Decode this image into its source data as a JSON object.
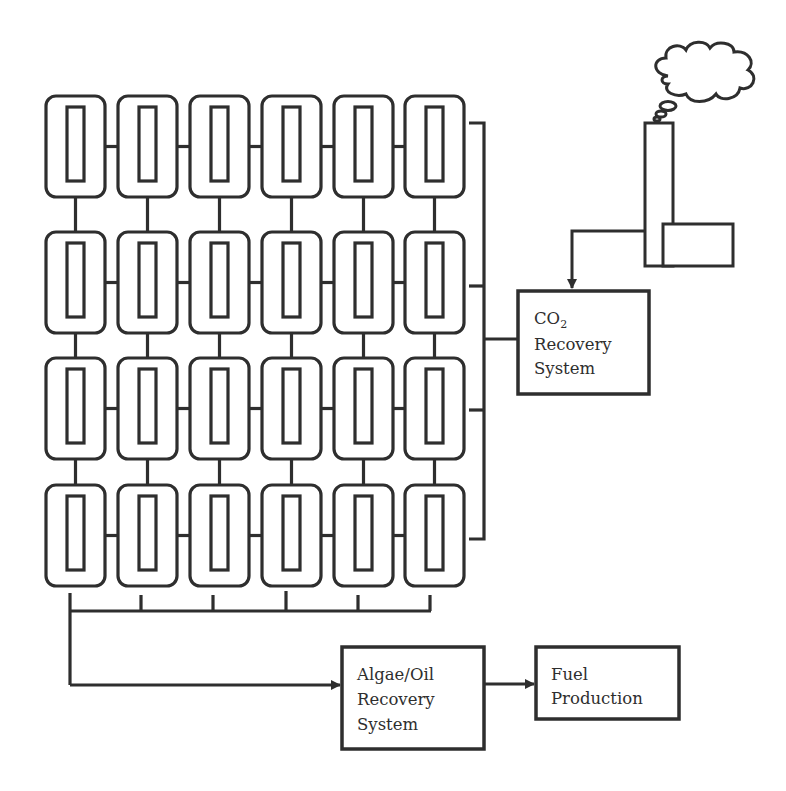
{
  "diagram": {
    "type": "process-flow",
    "stroke_color": "#2e2e2e",
    "background": "#ffffff",
    "photobioreactor_array": {
      "rows": 4,
      "columns": 6,
      "unit_count": 24
    },
    "boxes": {
      "co2_recovery": {
        "line1_main": "CO",
        "line1_sub": "2",
        "line2": "Recovery",
        "line3": "System"
      },
      "algae_oil_recovery": {
        "line1": "Algae/Oil",
        "line2": "Recovery",
        "line3": "System"
      },
      "fuel_production": {
        "line1": "Fuel",
        "line2": "Production"
      }
    },
    "emission_source": {
      "icon": "smokestack-icon",
      "emission": "cloud-icon"
    },
    "flows": [
      {
        "from": "smokestack",
        "to": "co2_recovery"
      },
      {
        "from": "co2_recovery",
        "to": "photobioreactor_array"
      },
      {
        "from": "photobioreactor_array",
        "to": "algae_oil_recovery"
      },
      {
        "from": "algae_oil_recovery",
        "to": "fuel_production"
      }
    ]
  }
}
